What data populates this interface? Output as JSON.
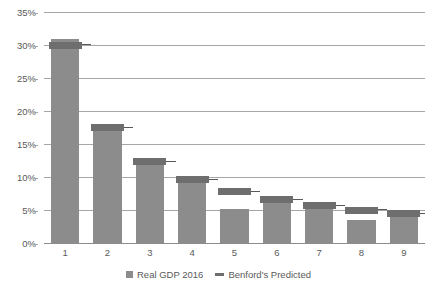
{
  "chart_data": {
    "type": "bar",
    "title": "",
    "subtitle": "",
    "xlabel": "",
    "ylabel": "",
    "categories": [
      "1",
      "2",
      "3",
      "4",
      "5",
      "6",
      "7",
      "8",
      "9"
    ],
    "ylim": [
      0,
      35
    ],
    "y_ticks": [
      0,
      5,
      10,
      15,
      20,
      25,
      30,
      35
    ],
    "y_tick_labels": [
      "0%",
      "5%",
      "10%",
      "15%",
      "20%",
      "25%",
      "30%",
      "35%"
    ],
    "y_unit": "%",
    "grid": true,
    "legend_position": "bottom",
    "series": [
      {
        "name": "Real GDP 2016",
        "marker": "square",
        "color": "#8c8c8c",
        "values": [
          31.0,
          17.7,
          12.6,
          9.8,
          5.3,
          6.8,
          6.0,
          3.7,
          4.6
        ]
      },
      {
        "name": "Benford's Predicted",
        "marker": "dash",
        "color": "#6e6e6e",
        "values": [
          30.1,
          17.6,
          12.5,
          9.7,
          7.9,
          6.7,
          5.8,
          5.1,
          4.6
        ]
      }
    ]
  },
  "legend": {
    "entries": [
      {
        "label": "Real GDP 2016"
      },
      {
        "label": "Benford's Predicted"
      }
    ]
  },
  "colors": {
    "bar": "#8c8c8c",
    "benford": "#6e6e6e",
    "gridline": "#a6a6a6",
    "text": "#595959",
    "background": "#ffffff"
  }
}
